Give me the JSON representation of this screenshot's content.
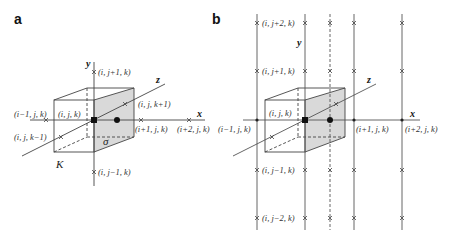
{
  "panels": {
    "a": {
      "label": "a",
      "axes": {
        "x": "x",
        "y": "y",
        "z": "z"
      },
      "points": {
        "up": "(i, j+1, k)",
        "down": "(i, j−1, k)",
        "left": "(i−1, j, k)",
        "center": "(i, j, k)",
        "right1": "(i+1, j, k)",
        "right2": "(i+2, j, k)",
        "front": "(i, j, k+1)",
        "back": "(i, j, k−1)"
      },
      "cell_label": "K",
      "face_label": "σ"
    },
    "b": {
      "label": "b",
      "axes": {
        "x": "x",
        "y": "y",
        "z": "z"
      },
      "points": {
        "up2": "(i, j+2, k)",
        "up1": "(i, j+1, k)",
        "left": "(i−1, j, k)",
        "center": "(i, j, k)",
        "right1": "(i+1, j, k)",
        "right2": "(i+2, j, k)",
        "down1": "(i, j−1, k)",
        "down2": "(i, j−2, k)"
      }
    }
  },
  "colors": {
    "line": "#444444",
    "face_fill": "#d9d9d9",
    "text": "#333333"
  }
}
